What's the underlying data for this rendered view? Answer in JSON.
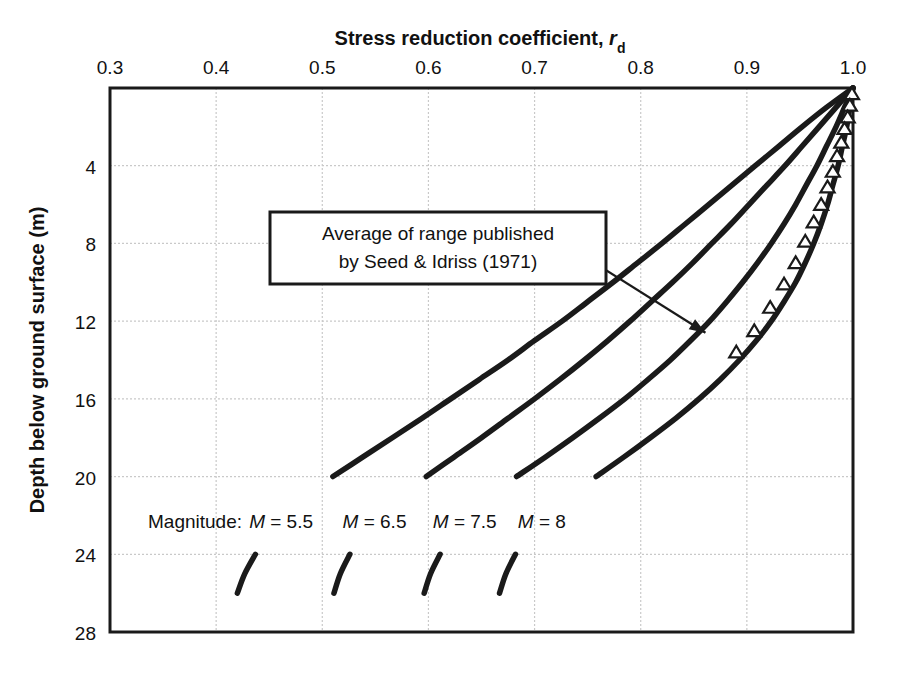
{
  "chart_data": {
    "type": "line",
    "title": "Stress reduction coefficient, r",
    "title_subscript": "d",
    "xlabel": "Stress reduction coefficient, r_d",
    "ylabel": "Depth below ground surface (m)",
    "xlim": [
      0.3,
      1.0
    ],
    "ylim": [
      0,
      28
    ],
    "y_inverted": true,
    "grid": true,
    "grid_style": "dotted-light-gray",
    "legend_position": "inline-curve-labels",
    "xticks": [
      0.3,
      0.4,
      0.5,
      0.6,
      0.7,
      0.8,
      0.9,
      1.0
    ],
    "xtick_labels": [
      "0.3",
      "0.4",
      "0.5",
      "0.6",
      "0.7",
      "0.8",
      "0.9",
      "1.0"
    ],
    "yticks": [
      4,
      8,
      12,
      16,
      20,
      24,
      28
    ],
    "ytick_labels": [
      "4",
      "8",
      "12",
      "16",
      "20",
      "24",
      "28"
    ],
    "series": [
      {
        "name": "M = 5.5",
        "label": "M = 5.5",
        "label_prefix": "M",
        "label_suffix": "= 5.5",
        "color": "#1a1a1a",
        "points": [
          [
            1.0,
            0.0
          ],
          [
            0.975,
            1.0
          ],
          [
            0.952,
            2.0
          ],
          [
            0.93,
            3.0
          ],
          [
            0.908,
            4.0
          ],
          [
            0.886,
            5.0
          ],
          [
            0.864,
            6.0
          ],
          [
            0.842,
            7.0
          ],
          [
            0.82,
            8.0
          ],
          [
            0.797,
            9.0
          ],
          [
            0.774,
            10.0
          ],
          [
            0.75,
            11.0
          ],
          [
            0.726,
            12.0
          ],
          [
            0.7,
            13.0
          ],
          [
            0.675,
            14.0
          ],
          [
            0.648,
            15.0
          ],
          [
            0.621,
            16.0
          ],
          [
            0.594,
            17.0
          ],
          [
            0.566,
            18.0
          ],
          [
            0.538,
            19.0
          ],
          [
            0.51,
            20.0
          ],
          [
            0.486,
            21.0
          ],
          [
            0.466,
            22.0
          ],
          [
            0.45,
            23.0
          ],
          [
            0.437,
            24.0
          ],
          [
            0.427,
            25.0
          ],
          [
            0.42,
            26.0
          ]
        ]
      },
      {
        "name": "M = 6.5",
        "label": "M = 6.5",
        "label_prefix": "M",
        "label_suffix": "= 6.5",
        "color": "#1a1a1a",
        "points": [
          [
            1.0,
            0.0
          ],
          [
            0.984,
            1.0
          ],
          [
            0.968,
            2.0
          ],
          [
            0.952,
            3.0
          ],
          [
            0.936,
            4.0
          ],
          [
            0.919,
            5.0
          ],
          [
            0.902,
            6.0
          ],
          [
            0.885,
            7.0
          ],
          [
            0.867,
            8.0
          ],
          [
            0.849,
            9.0
          ],
          [
            0.83,
            10.0
          ],
          [
            0.81,
            11.0
          ],
          [
            0.79,
            12.0
          ],
          [
            0.769,
            13.0
          ],
          [
            0.747,
            14.0
          ],
          [
            0.724,
            15.0
          ],
          [
            0.7,
            16.0
          ],
          [
            0.675,
            17.0
          ],
          [
            0.65,
            18.0
          ],
          [
            0.624,
            19.0
          ],
          [
            0.598,
            20.0
          ],
          [
            0.574,
            21.0
          ],
          [
            0.554,
            22.0
          ],
          [
            0.538,
            23.0
          ],
          [
            0.526,
            24.0
          ],
          [
            0.517,
            25.0
          ],
          [
            0.511,
            26.0
          ]
        ]
      },
      {
        "name": "M = 7.5",
        "label": "M = 7.5",
        "label_prefix": "M",
        "label_suffix": "= 7.5",
        "color": "#1a1a1a",
        "points": [
          [
            1.0,
            0.0
          ],
          [
            0.992,
            1.0
          ],
          [
            0.984,
            2.0
          ],
          [
            0.975,
            3.0
          ],
          [
            0.966,
            4.0
          ],
          [
            0.956,
            5.0
          ],
          [
            0.946,
            6.0
          ],
          [
            0.935,
            7.0
          ],
          [
            0.923,
            8.0
          ],
          [
            0.91,
            9.0
          ],
          [
            0.896,
            10.0
          ],
          [
            0.881,
            11.0
          ],
          [
            0.865,
            12.0
          ],
          [
            0.847,
            13.0
          ],
          [
            0.828,
            14.0
          ],
          [
            0.807,
            15.0
          ],
          [
            0.785,
            16.0
          ],
          [
            0.761,
            17.0
          ],
          [
            0.736,
            18.0
          ],
          [
            0.71,
            19.0
          ],
          [
            0.683,
            20.0
          ],
          [
            0.659,
            21.0
          ],
          [
            0.639,
            22.0
          ],
          [
            0.623,
            23.0
          ],
          [
            0.611,
            24.0
          ],
          [
            0.602,
            25.0
          ],
          [
            0.596,
            26.0
          ]
        ]
      },
      {
        "name": "M = 8",
        "label": "M = 8",
        "label_prefix": "M",
        "label_suffix": "= 8",
        "color": "#1a1a1a",
        "points": [
          [
            1.0,
            0.0
          ],
          [
            0.997,
            1.0
          ],
          [
            0.994,
            2.0
          ],
          [
            0.99,
            3.0
          ],
          [
            0.986,
            4.0
          ],
          [
            0.981,
            5.0
          ],
          [
            0.976,
            6.0
          ],
          [
            0.97,
            7.0
          ],
          [
            0.963,
            8.0
          ],
          [
            0.955,
            9.0
          ],
          [
            0.946,
            10.0
          ],
          [
            0.935,
            11.0
          ],
          [
            0.923,
            12.0
          ],
          [
            0.909,
            13.0
          ],
          [
            0.893,
            14.0
          ],
          [
            0.875,
            15.0
          ],
          [
            0.855,
            16.0
          ],
          [
            0.833,
            17.0
          ],
          [
            0.809,
            18.0
          ],
          [
            0.784,
            19.0
          ],
          [
            0.758,
            20.0
          ],
          [
            0.733,
            21.0
          ],
          [
            0.712,
            22.0
          ],
          [
            0.695,
            23.0
          ],
          [
            0.682,
            24.0
          ],
          [
            0.673,
            25.0
          ],
          [
            0.667,
            26.0
          ]
        ]
      }
    ],
    "markers": {
      "name": "Average of range published by Seed & Idriss (1971)",
      "shape": "open-triangle",
      "points": [
        [
          0.999,
          0.3
        ],
        [
          0.997,
          0.9
        ],
        [
          0.995,
          1.5
        ],
        [
          0.992,
          2.1
        ],
        [
          0.989,
          2.8
        ],
        [
          0.985,
          3.5
        ],
        [
          0.981,
          4.3
        ],
        [
          0.976,
          5.1
        ],
        [
          0.97,
          6.0
        ],
        [
          0.963,
          6.9
        ],
        [
          0.955,
          7.9
        ],
        [
          0.946,
          9.0
        ],
        [
          0.935,
          10.1
        ],
        [
          0.922,
          11.3
        ],
        [
          0.907,
          12.5
        ],
        [
          0.89,
          13.6
        ]
      ]
    },
    "annotations": [
      {
        "id": "seed-idriss-note",
        "line1": "Average of range published",
        "line2": "by Seed & Idriss (1971)",
        "box": true,
        "arrow_from": [
          0.704,
          7.2
        ],
        "arrow_to": [
          0.861,
          12.6
        ]
      }
    ],
    "magnitude_prefix_label": "Magnitude:",
    "curve_label_depth": 22.3
  },
  "axes": {
    "x_title_main": "Stress reduction coefficient, ",
    "x_title_symbol": "r",
    "x_title_subscript": "d",
    "y_title": "Depth below ground surface (m)"
  }
}
